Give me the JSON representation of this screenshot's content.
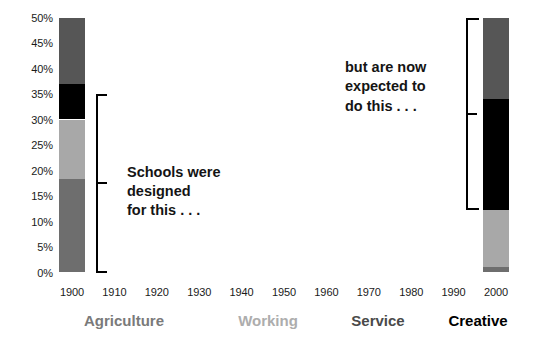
{
  "chart_data": {
    "type": "bar",
    "title": "",
    "subtitle": "",
    "xlabel": "",
    "ylabel": "",
    "stacked": true,
    "grid": false,
    "legend_position": "bottom",
    "ylim": [
      0,
      50
    ],
    "x_tick_labels": [
      "1900",
      "1910",
      "1920",
      "1930",
      "1940",
      "1950",
      "1960",
      "1970",
      "1980",
      "1990",
      "2000"
    ],
    "y_tick_labels": [
      "0%",
      "5%",
      "10%",
      "15%",
      "20%",
      "25%",
      "30%",
      "35%",
      "40%",
      "45%",
      "50%"
    ],
    "y_tick_values": [
      0,
      5,
      10,
      15,
      20,
      25,
      30,
      35,
      40,
      45,
      50
    ],
    "categories": [
      "1900",
      "2000"
    ],
    "series": [
      {
        "name": "Agriculture",
        "color": "#6e6e6e",
        "values": [
          18.3,
          1.0
        ]
      },
      {
        "name": "Working",
        "color": "#a8a8a8",
        "values": [
          11.7,
          11.3
        ]
      },
      {
        "name": "Creative",
        "color": "#000000",
        "values": [
          7.0,
          21.8
        ]
      },
      {
        "name": "Service",
        "color": "#565656",
        "values": [
          13.0,
          15.9
        ]
      }
    ],
    "bars": [
      {
        "category": "1900",
        "segments": [
          {
            "name": "Service",
            "color": "#565656",
            "from": 37.0,
            "to": 50.0
          },
          {
            "name": "Creative",
            "color": "#000000",
            "from": 30.0,
            "to": 37.0
          },
          {
            "name": "Working",
            "color": "#a8a8a8",
            "from": 18.3,
            "to": 30.0
          },
          {
            "name": "Agriculture",
            "color": "#6e6e6e",
            "from": 0.0,
            "to": 18.3
          }
        ]
      },
      {
        "category": "2000",
        "segments": [
          {
            "name": "Service",
            "color": "#565656",
            "from": 34.1,
            "to": 50.0
          },
          {
            "name": "Creative",
            "color": "#000000",
            "from": 12.3,
            "to": 34.1
          },
          {
            "name": "Working",
            "color": "#a8a8a8",
            "from": 1.0,
            "to": 12.3
          },
          {
            "name": "Agriculture",
            "color": "#6e6e6e",
            "from": 0.0,
            "to": 1.0
          }
        ]
      }
    ],
    "legend": [
      {
        "label": "Agriculture",
        "color": "#7a7a7a"
      },
      {
        "label": "Working",
        "color": "#adadad"
      },
      {
        "label": "Service",
        "color": "#4a4a4a"
      },
      {
        "label": "Creative",
        "color": "#000000"
      }
    ],
    "annotations": [
      {
        "id": "left",
        "text": "Schools were\ndesigned\nfor this . . .",
        "bracket_from": 0.0,
        "bracket_to": 35.0,
        "bracket_side": "left"
      },
      {
        "id": "right",
        "text": "but are now\nexpected to\ndo this . . .",
        "bracket_from": 12.3,
        "bracket_to": 50.0,
        "bracket_side": "right"
      }
    ]
  }
}
